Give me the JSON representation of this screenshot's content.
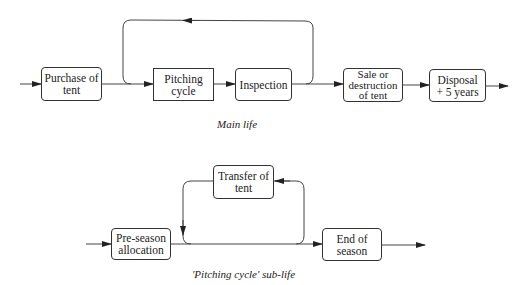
{
  "main_life": {
    "caption": "Main life",
    "nodes": [
      {
        "id": "purchase",
        "label": "Purchase of\ntent",
        "shape": "rounded"
      },
      {
        "id": "pitching",
        "label": "Pitching\ncycle",
        "shape": "square"
      },
      {
        "id": "inspection",
        "label": "Inspection",
        "shape": "rounded"
      },
      {
        "id": "sale",
        "label": "Sale or\ndestruction\nof tent",
        "shape": "rounded"
      },
      {
        "id": "disposal",
        "label": "Disposal\n+ 5 years",
        "shape": "rounded"
      }
    ],
    "edges": [
      {
        "from": "start",
        "to": "purchase"
      },
      {
        "from": "purchase",
        "to": "pitching"
      },
      {
        "from": "pitching",
        "to": "inspection"
      },
      {
        "from": "inspection",
        "to": "pitching",
        "type": "loop-back"
      },
      {
        "from": "inspection",
        "to": "sale"
      },
      {
        "from": "sale",
        "to": "disposal"
      },
      {
        "from": "disposal",
        "to": "end"
      }
    ]
  },
  "sub_life": {
    "caption": "'Pitching cycle' sub-life",
    "nodes": [
      {
        "id": "preseason",
        "label": "Pre-season\nallocation",
        "shape": "rounded"
      },
      {
        "id": "transfer",
        "label": "Transfer of\ntent",
        "shape": "rounded"
      },
      {
        "id": "endseason",
        "label": "End of\nseason",
        "shape": "rounded"
      }
    ],
    "edges": [
      {
        "from": "start",
        "to": "preseason"
      },
      {
        "from": "preseason",
        "to": "endseason"
      },
      {
        "from": "main-line",
        "to": "transfer",
        "type": "loop"
      },
      {
        "from": "transfer",
        "to": "main-line",
        "type": "loop"
      },
      {
        "from": "endseason",
        "to": "end"
      }
    ]
  }
}
